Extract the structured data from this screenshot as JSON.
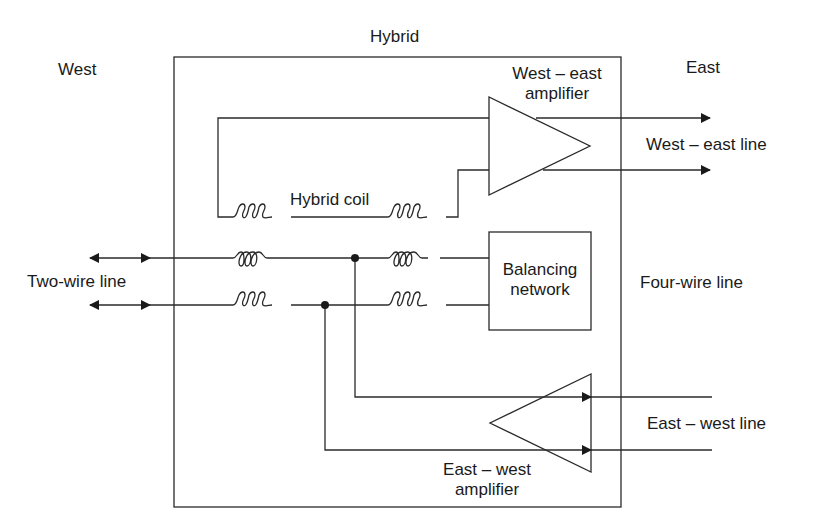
{
  "labels": {
    "hybrid": "Hybrid",
    "west": "West",
    "east": "East",
    "we_amp_line1": "West – east",
    "we_amp_line2": "amplifier",
    "we_line": "West – east line",
    "hybrid_coil": "Hybrid coil",
    "two_wire": "Two-wire line",
    "balancing_line1": "Balancing",
    "balancing_line2": "network",
    "four_wire": "Four-wire line",
    "ew_line": "East – west line",
    "ew_amp_line1": "East – west",
    "ew_amp_line2": "amplifier"
  },
  "colors": {
    "stroke": "#2a2a2a",
    "text": "#1a1a1a",
    "background": "#ffffff"
  }
}
